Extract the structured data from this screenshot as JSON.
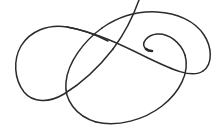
{
  "canvas": {
    "width": 222,
    "height": 129,
    "background_color": "#ffffff",
    "description": "Freehand continuous looping spiral line drawing"
  },
  "drawing": {
    "name": "looping-spiral-curve",
    "stroke_color": "#2b2b2b",
    "stroke_width": 1.5,
    "tip_stroke_width": 2.6,
    "strokes": [
      {
        "name": "main-continuous-curve",
        "path": "M 139 0 C 133 14 124 34 112 50 C 98 69 80 85 62 96 C 47 105 33 103 25 92 C 15 79 13 60 20 46 C 28 30 46 24 65 27 C 92 31 120 44 147 57 C 170 68 192 79 203 72 C 213 65 212 48 205 36 C 196 21 178 13 158 12 C 131 11 104 22 85 40 C 66 58 59 84 68 102 C 77 119 101 126 124 124 C 150 122 175 108 187 89 C 198 72 195 52 181 41 C 170 32 154 31 147 39 C 141 46 143 50 152 51"
      }
    ],
    "endpoints": [
      {
        "name": "free-end-top",
        "x": 139,
        "y": 0,
        "note": "exits top edge of frame"
      },
      {
        "name": "free-end-inner-tip",
        "x": 152,
        "y": 51,
        "note": "thickened terminus inside right loop"
      }
    ],
    "crossings": [
      {
        "name": "crossing-upper-center",
        "x": 122,
        "y": 26
      },
      {
        "name": "crossing-left-mid",
        "x": 70,
        "y": 75
      },
      {
        "name": "crossing-right-mid",
        "x": 170,
        "y": 82
      },
      {
        "name": "crossing-lower-center",
        "x": 128,
        "y": 116
      }
    ],
    "extents": {
      "left": 11,
      "right": 212,
      "top": 0,
      "bottom": 124
    }
  }
}
